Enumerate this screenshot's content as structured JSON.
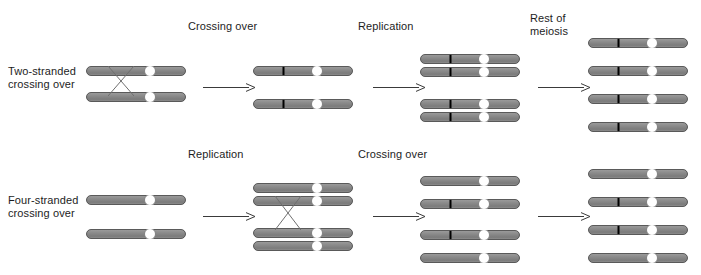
{
  "figure": {
    "title_present": false,
    "background_color": "#ffffff",
    "chromosome_color": "#8a8a8a",
    "chromosome_edge_color": "#4d4d4d",
    "band_color": "#000000",
    "centromere_fill": "#ffffff",
    "centromere_stroke": "#7a7a7a",
    "arrow_color": "#3a3a3a",
    "text_color": "#1d1d1d"
  },
  "stage_labels": [
    {
      "id": "row1-crossing-over",
      "text": "Crossing over",
      "x": 188,
      "y": 20
    },
    {
      "id": "row1-replication",
      "text": "Replication",
      "x": 358,
      "y": 20
    },
    {
      "id": "row1-rest-of-meiosis",
      "text": "Rest of\nmeiosis",
      "x": 530,
      "y": 12
    },
    {
      "id": "row2-replication",
      "text": "Replication",
      "x": 188,
      "y": 148
    },
    {
      "id": "row2-crossing-over",
      "text": "Crossing over",
      "x": 358,
      "y": 148
    }
  ],
  "row_labels": [
    {
      "id": "two-stranded",
      "text": "Two-stranded\ncrossing over",
      "x": 8,
      "y": 65
    },
    {
      "id": "four-stranded",
      "text": "Four-stranded\ncrossing over",
      "x": 8,
      "y": 194
    }
  ],
  "arrows": [
    {
      "id": "row1-arrow-1",
      "x": 203,
      "y": 79,
      "width": 52
    },
    {
      "id": "row1-arrow-2",
      "x": 373,
      "y": 79,
      "width": 52
    },
    {
      "id": "row1-arrow-3",
      "x": 538,
      "y": 79,
      "width": 52
    },
    {
      "id": "row2-arrow-1",
      "x": 203,
      "y": 208,
      "width": 52
    },
    {
      "id": "row2-arrow-2",
      "x": 373,
      "y": 208,
      "width": 52
    },
    {
      "id": "row2-arrow-3",
      "x": 538,
      "y": 208,
      "width": 52
    }
  ],
  "chromosomes": [
    {
      "id": "r1c1-s1",
      "row": 1,
      "col": 1,
      "x": 86,
      "y": 62,
      "width": 100,
      "band": false
    },
    {
      "id": "r1c1-s2",
      "row": 1,
      "col": 1,
      "x": 86,
      "y": 88,
      "width": 100,
      "band": false
    },
    {
      "id": "r1c2-s1",
      "row": 1,
      "col": 2,
      "x": 253,
      "y": 62,
      "width": 100,
      "band": true
    },
    {
      "id": "r1c2-s2",
      "row": 1,
      "col": 2,
      "x": 253,
      "y": 95,
      "width": 100,
      "band": true
    },
    {
      "id": "r1c3-s1",
      "row": 1,
      "col": 3,
      "x": 420,
      "y": 50,
      "width": 100,
      "band": true
    },
    {
      "id": "r1c3-s2",
      "row": 1,
      "col": 3,
      "x": 420,
      "y": 63,
      "width": 100,
      "band": true
    },
    {
      "id": "r1c3-s3",
      "row": 1,
      "col": 3,
      "x": 420,
      "y": 95,
      "width": 100,
      "band": true
    },
    {
      "id": "r1c3-s4",
      "row": 1,
      "col": 3,
      "x": 420,
      "y": 108,
      "width": 100,
      "band": true
    },
    {
      "id": "r1c4-s1",
      "row": 1,
      "col": 4,
      "x": 588,
      "y": 34,
      "width": 100,
      "band": true
    },
    {
      "id": "r1c4-s2",
      "row": 1,
      "col": 4,
      "x": 588,
      "y": 62,
      "width": 100,
      "band": true
    },
    {
      "id": "r1c4-s3",
      "row": 1,
      "col": 4,
      "x": 588,
      "y": 90,
      "width": 100,
      "band": true
    },
    {
      "id": "r1c4-s4",
      "row": 1,
      "col": 4,
      "x": 588,
      "y": 118,
      "width": 100,
      "band": true
    },
    {
      "id": "r2c1-s1",
      "row": 2,
      "col": 1,
      "x": 86,
      "y": 191,
      "width": 100,
      "band": false
    },
    {
      "id": "r2c1-s2",
      "row": 2,
      "col": 1,
      "x": 86,
      "y": 225,
      "width": 100,
      "band": false
    },
    {
      "id": "r2c2-s1",
      "row": 2,
      "col": 2,
      "x": 253,
      "y": 179,
      "width": 100,
      "band": false
    },
    {
      "id": "r2c2-s2",
      "row": 2,
      "col": 2,
      "x": 253,
      "y": 192,
      "width": 100,
      "band": false
    },
    {
      "id": "r2c2-s3",
      "row": 2,
      "col": 2,
      "x": 253,
      "y": 224,
      "width": 100,
      "band": false
    },
    {
      "id": "r2c2-s4",
      "row": 2,
      "col": 2,
      "x": 253,
      "y": 237,
      "width": 100,
      "band": false
    },
    {
      "id": "r2c3-s1",
      "row": 2,
      "col": 3,
      "x": 420,
      "y": 172,
      "width": 100,
      "band": false
    },
    {
      "id": "r2c3-s2",
      "row": 2,
      "col": 3,
      "x": 420,
      "y": 195,
      "width": 100,
      "band": true
    },
    {
      "id": "r2c3-s3",
      "row": 2,
      "col": 3,
      "x": 420,
      "y": 226,
      "width": 100,
      "band": true
    },
    {
      "id": "r2c3-s4",
      "row": 2,
      "col": 3,
      "x": 420,
      "y": 249,
      "width": 100,
      "band": false
    },
    {
      "id": "r2c4-s1",
      "row": 2,
      "col": 4,
      "x": 588,
      "y": 165,
      "width": 100,
      "band": false
    },
    {
      "id": "r2c4-s2",
      "row": 2,
      "col": 4,
      "x": 588,
      "y": 193,
      "width": 100,
      "band": true
    },
    {
      "id": "r2c4-s3",
      "row": 2,
      "col": 4,
      "x": 588,
      "y": 221,
      "width": 100,
      "band": true
    },
    {
      "id": "r2c4-s4",
      "row": 2,
      "col": 4,
      "x": 588,
      "y": 249,
      "width": 100,
      "band": false
    }
  ],
  "crossovers": [
    {
      "id": "r1c1-crossover",
      "x": 108,
      "y": 66,
      "width": 26,
      "height": 30
    },
    {
      "id": "r2c2-crossover",
      "x": 275,
      "y": 196,
      "width": 26,
      "height": 34
    }
  ],
  "geometry": {
    "chromosome_height": 10,
    "centromere_offset_ratio": 0.64,
    "centromere_radius": 5.5,
    "band_offset_ratio": 0.295,
    "band_width": 2
  }
}
